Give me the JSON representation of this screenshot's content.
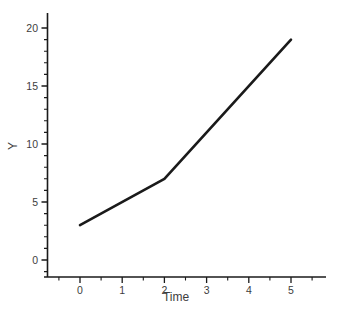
{
  "chart_data": {
    "type": "line",
    "title": "",
    "xlabel": "Time",
    "ylabel": "Y",
    "x": [
      0,
      2,
      5
    ],
    "y": [
      3,
      7,
      19
    ],
    "series": [
      {
        "name": "Y",
        "x": [
          0,
          2,
          5
        ],
        "y": [
          3,
          7,
          19
        ]
      }
    ],
    "xticks": [
      0,
      1,
      2,
      3,
      4,
      5
    ],
    "yticks": [
      0,
      5,
      10,
      15,
      20
    ],
    "x_minor_ticks": [
      -0.5,
      0.5,
      1.5,
      2.5,
      3.5,
      4.5,
      5.5
    ],
    "y_minor_ticks": [
      -1,
      1,
      2,
      3,
      4,
      6,
      7,
      8,
      9,
      11,
      12,
      13,
      14,
      16,
      17,
      18,
      19
    ],
    "xlim": [
      -0.9,
      5.9
    ],
    "ylim": [
      -1.5,
      21.3
    ],
    "grid": false,
    "legend": null,
    "line_color": "#1a1a1a",
    "axis_color": "#1a1a1a",
    "label_color": "#3d3d3d",
    "background": "#ffffff"
  }
}
